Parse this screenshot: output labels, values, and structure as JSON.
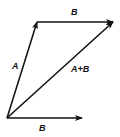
{
  "diagram": {
    "stroke_color": "#111111",
    "background": "#ffffff",
    "origin": {
      "x": 7,
      "y": 118
    },
    "vectors": [
      {
        "id": "A",
        "label": "A",
        "from": {
          "x": 7,
          "y": 118
        },
        "to": {
          "x": 37,
          "y": 22
        }
      },
      {
        "id": "B_top",
        "label": "B",
        "from": {
          "x": 37,
          "y": 22
        },
        "to": {
          "x": 113,
          "y": 22
        }
      },
      {
        "id": "A_plus_B",
        "label": "A+B",
        "from": {
          "x": 7,
          "y": 118
        },
        "to": {
          "x": 113,
          "y": 22
        }
      },
      {
        "id": "B_bottom",
        "label": "B",
        "from": {
          "x": 7,
          "y": 118
        },
        "to": {
          "x": 82,
          "y": 118
        }
      }
    ],
    "labels": {
      "a": "A",
      "b_top": "B",
      "a_plus_b": "A+B",
      "b_bottom": "B"
    }
  }
}
